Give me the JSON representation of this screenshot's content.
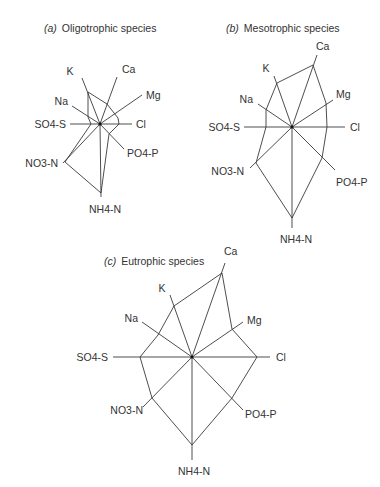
{
  "figure": {
    "panels": [
      {
        "id": "a",
        "tag": "(a)",
        "title": "Oligotrophic species",
        "center": [
          100,
          124
        ],
        "axes": [
          {
            "name": "K",
            "label": "K",
            "end": [
              82,
              78
            ],
            "label_pos": [
              70,
              75
            ],
            "anchor": "middle"
          },
          {
            "name": "Ca",
            "label": "Ca",
            "end": [
              117,
              77
            ],
            "label_pos": [
              122,
              73
            ],
            "anchor": "start"
          },
          {
            "name": "Mg",
            "label": "Mg",
            "end": [
              142,
              95
            ],
            "label_pos": [
              146,
              99
            ],
            "anchor": "start"
          },
          {
            "name": "Cl",
            "label": "Cl",
            "end": [
              132,
              124
            ],
            "label_pos": [
              136,
              128
            ],
            "anchor": "start"
          },
          {
            "name": "PO4-P",
            "label": "PO4-P",
            "end": [
              124,
              149
            ],
            "label_pos": [
              127,
              157
            ],
            "anchor": "start"
          },
          {
            "name": "NH4-N",
            "label": "NH4-N",
            "end": [
              101,
              197
            ],
            "label_pos": [
              89,
              213
            ],
            "anchor": "start"
          },
          {
            "name": "NO3-N",
            "label": "NO3-N",
            "end": [
              63,
              163
            ],
            "label_pos": [
              58,
              167
            ],
            "anchor": "end"
          },
          {
            "name": "SO4-S",
            "label": "SO4-S",
            "end": [
              70,
              124
            ],
            "label_pos": [
              66,
              128
            ],
            "anchor": "end"
          },
          {
            "name": "Na",
            "label": "Na",
            "end": [
              72,
              106
            ],
            "label_pos": [
              68,
              105
            ],
            "anchor": "end"
          }
        ],
        "polygon": [
          [
            88,
            92
          ],
          [
            107,
            104
          ],
          [
            118,
            118
          ],
          [
            119,
            124
          ],
          [
            109,
            134
          ],
          [
            101,
            193
          ],
          [
            65,
            162
          ],
          [
            91,
            124
          ],
          [
            88,
            117
          ],
          [
            88,
            92
          ]
        ]
      },
      {
        "id": "b",
        "tag": "(b)",
        "title": "Mesotrophic species",
        "center": [
          292,
          127
        ],
        "axes": [
          {
            "name": "Ca",
            "label": "Ca",
            "end": [
              317,
              55
            ],
            "label_pos": [
              316,
              50
            ],
            "anchor": "start"
          },
          {
            "name": "K",
            "label": "K",
            "end": [
              274,
              76
            ],
            "label_pos": [
              266,
              72
            ],
            "anchor": "middle"
          },
          {
            "name": "Na",
            "label": "Na",
            "end": [
              258,
              104
            ],
            "label_pos": [
              253,
              103
            ],
            "anchor": "end"
          },
          {
            "name": "Mg",
            "label": "Mg",
            "end": [
              333,
              100
            ],
            "label_pos": [
              336,
              98
            ],
            "anchor": "start"
          },
          {
            "name": "SO4-S",
            "label": "SO4-S",
            "end": [
              244,
              127
            ],
            "label_pos": [
              240,
              131
            ],
            "anchor": "end"
          },
          {
            "name": "Cl",
            "label": "Cl",
            "end": [
              345,
              127
            ],
            "label_pos": [
              350,
              131
            ],
            "anchor": "start"
          },
          {
            "name": "NO3-N",
            "label": "NO3-N",
            "end": [
              250,
              168
            ],
            "label_pos": [
              244,
              175
            ],
            "anchor": "end"
          },
          {
            "name": "PO4-P",
            "label": "PO4-P",
            "end": [
              335,
              170
            ],
            "label_pos": [
              336,
              186
            ],
            "anchor": "start"
          },
          {
            "name": "NH4-N",
            "label": "NH4-N",
            "end": [
              292,
              228
            ],
            "label_pos": [
              280,
              243
            ],
            "anchor": "start"
          }
        ],
        "polygon": [
          [
            313,
            65
          ],
          [
            326,
            103
          ],
          [
            327,
            127
          ],
          [
            322,
            158
          ],
          [
            292,
            218
          ],
          [
            256,
            163
          ],
          [
            266,
            127
          ],
          [
            266,
            110
          ],
          [
            277,
            83
          ],
          [
            313,
            65
          ]
        ]
      },
      {
        "id": "c",
        "tag": "(c)",
        "title": "Eutrophic species",
        "center": [
          192,
          357
        ],
        "axes": [
          {
            "name": "Ca",
            "label": "Ca",
            "end": [
              225,
              263
            ],
            "label_pos": [
              224,
              255
            ],
            "anchor": "start"
          },
          {
            "name": "K",
            "label": "K",
            "end": [
              170,
              295
            ],
            "label_pos": [
              162,
              292
            ],
            "anchor": "middle"
          },
          {
            "name": "Na",
            "label": "Na",
            "end": [
              142,
              322
            ],
            "label_pos": [
              138,
              322
            ],
            "anchor": "end"
          },
          {
            "name": "Mg",
            "label": "Mg",
            "end": [
              243,
              322
            ],
            "label_pos": [
              247,
              324
            ],
            "anchor": "start"
          },
          {
            "name": "SO4-S",
            "label": "SO4-S",
            "end": [
              113,
              357
            ],
            "label_pos": [
              108,
              361
            ],
            "anchor": "end"
          },
          {
            "name": "Cl",
            "label": "Cl",
            "end": [
              270,
              357
            ],
            "label_pos": [
              276,
              361
            ],
            "anchor": "start"
          },
          {
            "name": "NO3-N",
            "label": "NO3-N",
            "end": [
              143,
              407
            ],
            "label_pos": [
              143,
              414
            ],
            "anchor": "end"
          },
          {
            "name": "PO4-P",
            "label": "PO4-P",
            "end": [
              243,
              410
            ],
            "label_pos": [
              245,
              418
            ],
            "anchor": "start"
          },
          {
            "name": "NH4-N",
            "label": "NH4-N",
            "end": [
              192,
              460
            ],
            "label_pos": [
              178,
              475
            ],
            "anchor": "start"
          }
        ],
        "polygon": [
          [
            222,
            273
          ],
          [
            232,
            329
          ],
          [
            257,
            357
          ],
          [
            232,
            398
          ],
          [
            192,
            445
          ],
          [
            152,
            398
          ],
          [
            140,
            357
          ],
          [
            158,
            335
          ],
          [
            174,
            306
          ],
          [
            222,
            273
          ]
        ]
      }
    ],
    "title_positions": {
      "a": [
        44,
        32
      ],
      "b": [
        226,
        32
      ],
      "c": [
        104,
        265
      ]
    }
  }
}
